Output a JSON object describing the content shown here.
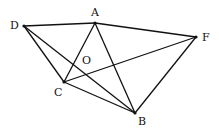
{
  "diagram": {
    "type": "geometric-figure",
    "points": {
      "D": {
        "label": "D",
        "x": 24,
        "y": 26,
        "lx": 10,
        "ly": 29
      },
      "A": {
        "label": "A",
        "x": 95,
        "y": 23,
        "lx": 91,
        "ly": 16
      },
      "F": {
        "label": "F",
        "x": 196,
        "y": 37,
        "lx": 202,
        "ly": 41
      },
      "C": {
        "label": "C",
        "x": 64,
        "y": 82,
        "lx": 54,
        "ly": 96
      },
      "B": {
        "label": "B",
        "x": 135,
        "y": 113,
        "lx": 138,
        "ly": 125
      },
      "O": {
        "label": "O",
        "x": 73,
        "y": 65,
        "lx": 82,
        "ly": 64
      }
    },
    "segments": [
      [
        "D",
        "A"
      ],
      [
        "A",
        "F"
      ],
      [
        "D",
        "C"
      ],
      [
        "D",
        "B"
      ],
      [
        "C",
        "A"
      ],
      [
        "C",
        "F"
      ],
      [
        "C",
        "B"
      ],
      [
        "A",
        "B"
      ],
      [
        "F",
        "B"
      ]
    ],
    "colors": {
      "stroke": "#111111",
      "background": "#ffffff"
    }
  }
}
